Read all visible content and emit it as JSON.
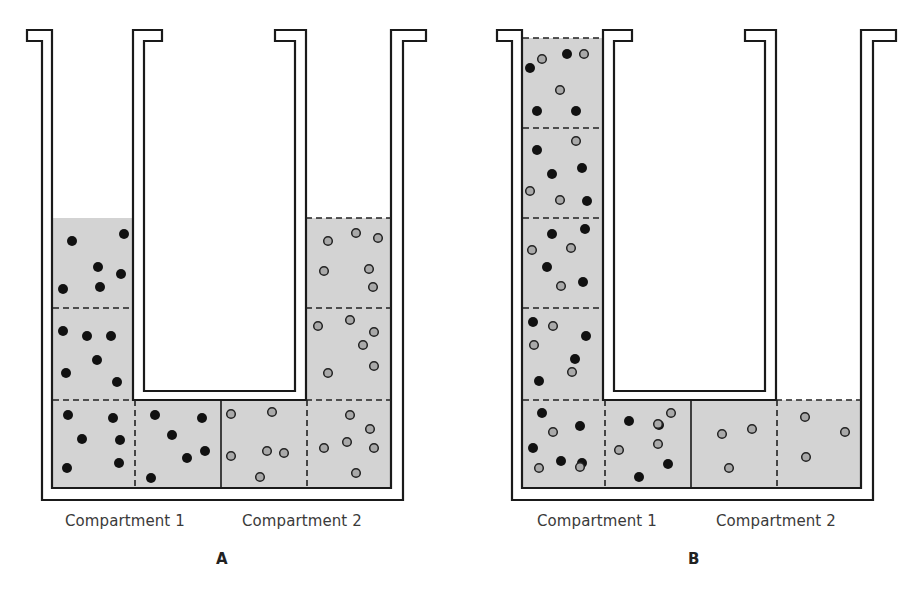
{
  "colors": {
    "fluid": "#d3d3d3",
    "stroke": "#1a1a1a",
    "solute_filled": "#111111",
    "solute_open_fill": "#a9a9a9",
    "solute_open_stroke": "#222222",
    "background": "#ffffff"
  },
  "legend": {
    "filled_circle": "solute-type-1",
    "open_circle": "solute-type-2"
  },
  "panels": [
    {
      "id": "A",
      "letter": "A",
      "offset_x": 0,
      "compartment_labels": [
        "Compartment 1",
        "Compartment 2"
      ],
      "label_positions": [
        [
          65,
          512
        ],
        [
          242,
          512
        ]
      ],
      "letter_position": [
        216,
        550
      ],
      "fluid_regions": [
        {
          "x": 53,
          "y": 218,
          "w": 81,
          "h": 182
        },
        {
          "x": 53,
          "y": 400,
          "w": 338,
          "h": 88
        },
        {
          "x": 306,
          "y": 218,
          "w": 85,
          "h": 182
        }
      ],
      "dashed_lines": [
        [
          53,
          308,
          133,
          308
        ],
        [
          53,
          400,
          133,
          400
        ],
        [
          306,
          218,
          391,
          218
        ],
        [
          306,
          308,
          391,
          308
        ],
        [
          306,
          400,
          391,
          400
        ],
        [
          135,
          400,
          135,
          488
        ],
        [
          307,
          400,
          307,
          488
        ]
      ],
      "membrane_x": 221,
      "filled_dots": [
        [
          72,
          241
        ],
        [
          124,
          234
        ],
        [
          98,
          267
        ],
        [
          121,
          274
        ],
        [
          63,
          289
        ],
        [
          100,
          287
        ],
        [
          63,
          331
        ],
        [
          87,
          336
        ],
        [
          111,
          336
        ],
        [
          97,
          360
        ],
        [
          66,
          373
        ],
        [
          117,
          382
        ],
        [
          68,
          415
        ],
        [
          113,
          418
        ],
        [
          82,
          439
        ],
        [
          120,
          440
        ],
        [
          67,
          468
        ],
        [
          119,
          463
        ],
        [
          155,
          415
        ],
        [
          202,
          418
        ],
        [
          172,
          435
        ],
        [
          205,
          451
        ],
        [
          187,
          458
        ],
        [
          151,
          478
        ]
      ],
      "open_dots": [
        [
          231,
          414
        ],
        [
          272,
          412
        ],
        [
          231,
          456
        ],
        [
          267,
          451
        ],
        [
          284,
          453
        ],
        [
          260,
          477
        ],
        [
          328,
          241
        ],
        [
          356,
          233
        ],
        [
          378,
          238
        ],
        [
          324,
          271
        ],
        [
          369,
          269
        ],
        [
          373,
          287
        ],
        [
          318,
          326
        ],
        [
          350,
          320
        ],
        [
          374,
          332
        ],
        [
          363,
          345
        ],
        [
          374,
          366
        ],
        [
          328,
          373
        ],
        [
          350,
          415
        ],
        [
          370,
          429
        ],
        [
          347,
          442
        ],
        [
          374,
          448
        ],
        [
          324,
          448
        ],
        [
          356,
          473
        ]
      ]
    },
    {
      "id": "B",
      "letter": "B",
      "offset_x": 470,
      "compartment_labels": [
        "Compartment 1",
        "Compartment 2"
      ],
      "label_positions": [
        [
          537,
          512
        ],
        [
          716,
          512
        ]
      ],
      "letter_position": [
        688,
        550
      ],
      "fluid_regions": [
        {
          "x": 523,
          "y": 38,
          "w": 81,
          "h": 362
        },
        {
          "x": 523,
          "y": 400,
          "w": 338,
          "h": 88
        }
      ],
      "dashed_lines": [
        [
          523,
          38,
          603,
          38
        ],
        [
          523,
          128,
          603,
          128
        ],
        [
          523,
          218,
          603,
          218
        ],
        [
          523,
          308,
          603,
          308
        ],
        [
          523,
          400,
          603,
          400
        ],
        [
          776,
          400,
          861,
          400
        ],
        [
          605,
          400,
          605,
          488
        ],
        [
          777,
          400,
          777,
          488
        ]
      ],
      "membrane_x": 691,
      "filled_dots": [
        [
          530,
          68
        ],
        [
          567,
          54
        ],
        [
          537,
          111
        ],
        [
          576,
          111
        ],
        [
          537,
          150
        ],
        [
          552,
          174
        ],
        [
          582,
          168
        ],
        [
          587,
          201
        ],
        [
          552,
          234
        ],
        [
          585,
          229
        ],
        [
          547,
          267
        ],
        [
          583,
          282
        ],
        [
          533,
          322
        ],
        [
          586,
          336
        ],
        [
          575,
          359
        ],
        [
          539,
          381
        ],
        [
          542,
          413
        ],
        [
          580,
          426
        ],
        [
          533,
          448
        ],
        [
          561,
          461
        ],
        [
          582,
          463
        ],
        [
          629,
          421
        ],
        [
          659,
          425
        ],
        [
          668,
          464
        ],
        [
          639,
          477
        ]
      ],
      "open_dots": [
        [
          542,
          59
        ],
        [
          584,
          54
        ],
        [
          560,
          90
        ],
        [
          576,
          141
        ],
        [
          530,
          191
        ],
        [
          560,
          200
        ],
        [
          532,
          250
        ],
        [
          571,
          248
        ],
        [
          561,
          286
        ],
        [
          553,
          326
        ],
        [
          534,
          345
        ],
        [
          572,
          372
        ],
        [
          553,
          432
        ],
        [
          539,
          468
        ],
        [
          580,
          467
        ],
        [
          671,
          413
        ],
        [
          619,
          450
        ],
        [
          658,
          444
        ],
        [
          658,
          424
        ],
        [
          722,
          434
        ],
        [
          752,
          429
        ],
        [
          729,
          468
        ],
        [
          805,
          417
        ],
        [
          845,
          432
        ],
        [
          806,
          457
        ]
      ]
    }
  ]
}
